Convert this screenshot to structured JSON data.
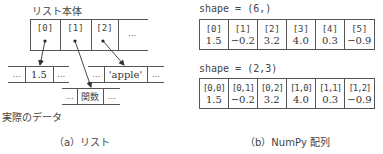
{
  "panel_a": {
    "list_body_label": "リスト本体",
    "list_cells": [
      {
        "label": "[0]"
      },
      {
        "label": "[1]"
      },
      {
        "label": "[2]"
      },
      {
        "label": "…"
      }
    ],
    "data_blocks": [
      {
        "cells": [
          "…",
          "1.5",
          "…"
        ]
      },
      {
        "cells": [
          "…",
          "'apple'",
          "…"
        ]
      },
      {
        "cells": [
          "…",
          "関数",
          "…"
        ]
      }
    ],
    "actual_data_label": "実際のデータ",
    "caption": "（a）リスト"
  },
  "panel_b": {
    "shape1_label": "shape = (6,)",
    "table1": {
      "indices": [
        "[0]",
        "[1]",
        "[2]",
        "[3]",
        "[4]",
        "[5]"
      ],
      "values": [
        "1.5",
        "−0.2",
        "3.2",
        "4.0",
        "0.3",
        "−0.9"
      ]
    },
    "shape2_label": "shape = (2,3)",
    "table2": {
      "indices": [
        "[0,0]",
        "[0,1]",
        "[0,2]",
        "[1,0]",
        "[1,1]",
        "[1,2]"
      ],
      "values": [
        "1.5",
        "−0.2",
        "3.2",
        "4.0",
        "0.3",
        "−0.9"
      ]
    },
    "caption": "（b）NumPy 配列"
  }
}
